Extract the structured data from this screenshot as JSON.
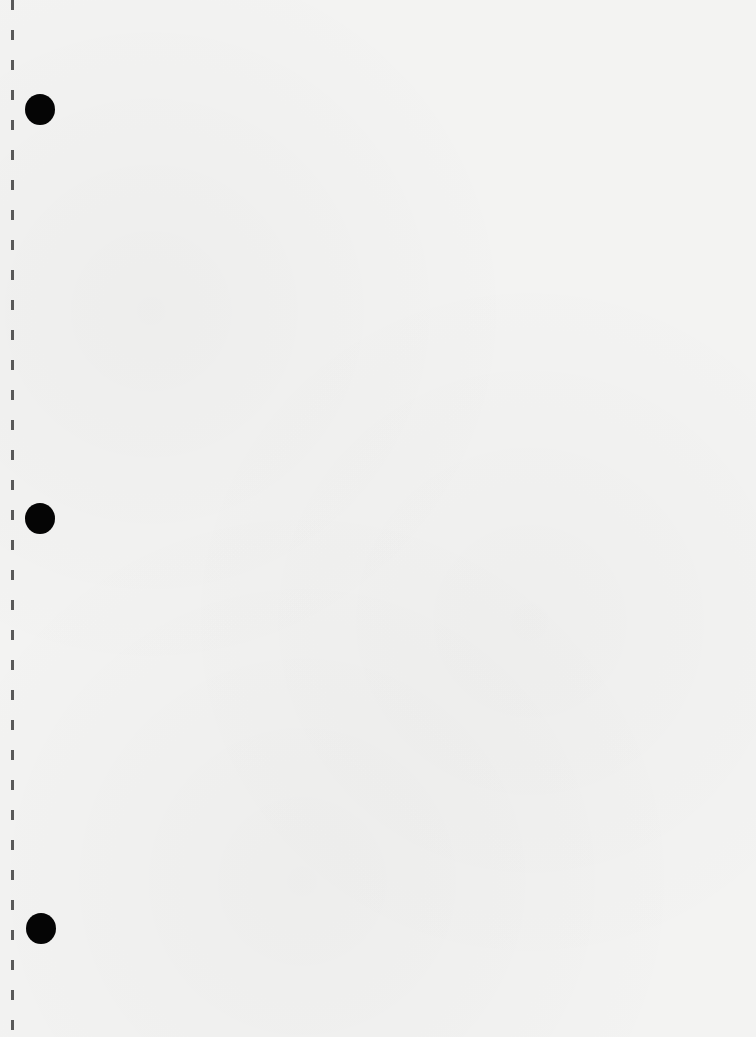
{
  "document": {
    "type": "blank hole-punched paper sheet",
    "text": "",
    "paper_color": "#f3f3f2",
    "hole_color": "#050505",
    "holes": [
      {
        "id": "top",
        "cx": 40,
        "cy": 109
      },
      {
        "id": "middle",
        "cx": 40,
        "cy": 519
      },
      {
        "id": "bottom",
        "cx": 41,
        "cy": 929
      }
    ]
  }
}
